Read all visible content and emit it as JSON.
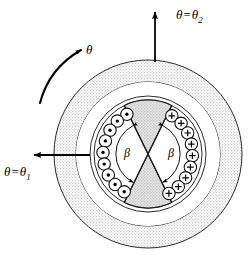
{
  "figure": {
    "background_color": "#ffffff",
    "line_color": "#000000",
    "stipple_fill_color": "#ededed",
    "wedge_fill_color": "#d9d9d9",
    "white_fill_color": "#ffffff",
    "width": 252,
    "height": 259
  },
  "labels": {
    "theta_rotation": {
      "text": "θ",
      "name": "rotation-angle-theta"
    },
    "theta_one": {
      "symbol": "θ",
      "equals": "=",
      "value_symbol": "θ",
      "subscript": "1",
      "full_text": "θ = θ₁"
    },
    "theta_two": {
      "symbol": "θ",
      "equals": "=",
      "value_symbol": "θ",
      "subscript": "2",
      "full_text": "θ = θ₂"
    },
    "beta_left": {
      "text": "β"
    },
    "beta_right": {
      "text": "β"
    }
  },
  "geometry": {
    "center": {
      "x": 148,
      "y": 154
    },
    "radii": {
      "outer_stator_outer": 94,
      "outer_stator_inner": 72,
      "airgap_outer": 72,
      "airgap_inner": 58,
      "rotor_outer": 54,
      "conductor_ring": 45,
      "beta_arc": 32
    },
    "wedge_half_angle_deg": 26,
    "conductor_circle_radius": 6.2
  },
  "conductors": {
    "left_group": {
      "symbol": "dot",
      "meaning": "current-out-of-page",
      "count": 9,
      "angles_deg": [
        118,
        133,
        148,
        163,
        178,
        193,
        208,
        223,
        238
      ]
    },
    "right_group": {
      "symbol": "plus",
      "meaning": "current-into-page",
      "count": 9,
      "angles_deg": [
        -58,
        -43,
        -28,
        -13,
        2,
        17,
        32,
        47,
        62
      ]
    }
  },
  "arrows": {
    "theta_two_arrow": {
      "name": "theta-two-reference-arrow",
      "direction": "up",
      "from": {
        "x": 155,
        "y": 62
      },
      "to": {
        "x": 155,
        "y": 10
      }
    },
    "theta_one_arrow": {
      "name": "theta-one-reference-arrow",
      "direction": "left",
      "from": {
        "x": 90,
        "y": 155
      },
      "to": {
        "x": 32,
        "y": 155
      }
    },
    "rotation_arrow": {
      "name": "rotation-direction-arrow",
      "direction": "counterclockwise-indicator",
      "style": "curved"
    }
  }
}
